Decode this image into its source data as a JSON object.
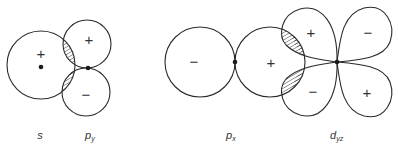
{
  "diagrams": [
    {
      "name": "s-py-overlap",
      "labels": {
        "s": "s",
        "p": "p",
        "p_sub": "y"
      },
      "signs": {
        "s_lobe": "+",
        "py_upper": "+",
        "py_lower": "−"
      }
    },
    {
      "name": "px-dyz-overlap",
      "labels": {
        "p": "p",
        "p_sub": "x",
        "d": "d",
        "d_sub": "yz"
      },
      "signs": {
        "px_left": "−",
        "px_right": "+",
        "dyz_upper_left": "+",
        "dyz_upper_right": "−",
        "dyz_lower_left": "−",
        "dyz_lower_right": "+"
      }
    }
  ]
}
